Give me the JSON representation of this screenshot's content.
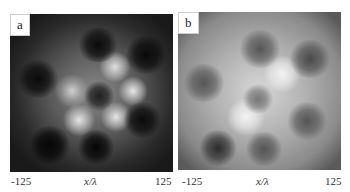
{
  "figure": {
    "panels": [
      {
        "label": "a",
        "x_min_tick": "-125",
        "x_max_tick": "125",
        "x_axis_label": "x/λ",
        "description": "grayscale intensity pattern, dark background, bright ring of lobes around dark center with dark lobes around"
      },
      {
        "label": "b",
        "x_min_tick": "-125",
        "x_max_tick": "125",
        "x_axis_label": "x/λ",
        "description": "grayscale intensity pattern, lighter gray background, similar lobe structure with lower contrast"
      }
    ]
  }
}
